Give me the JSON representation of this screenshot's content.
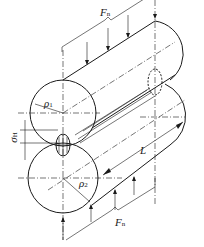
{
  "figure": {
    "labels": {
      "force_top": "F",
      "force_top_sub": "n",
      "force_bottom": "F",
      "force_bottom_sub": "n",
      "radius_top": "ρ",
      "radius_top_sub": "1",
      "radius_bottom": "ρ",
      "radius_bottom_sub": "2",
      "contact_stress": "σ",
      "contact_stress_sub": "H",
      "length": "L"
    },
    "colors": {
      "line": "#1a1a1a",
      "background": "#ffffff"
    }
  }
}
